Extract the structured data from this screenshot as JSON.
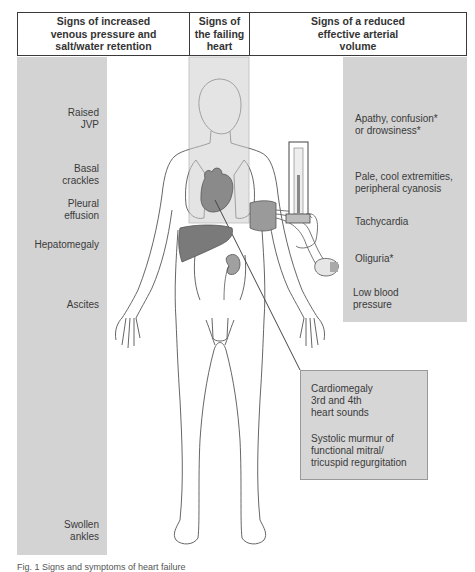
{
  "header": {
    "columns": [
      {
        "label": "Signs of increased venous pressure and salt/water retention",
        "lines": [
          "Signs of increased",
          "venous pressure and",
          "salt/water retention"
        ]
      },
      {
        "label": "Signs of the failing heart",
        "lines": [
          "Signs of",
          "the failing",
          "heart"
        ]
      },
      {
        "label": "Signs of a reduced effective arterial volume",
        "lines": [
          "Signs of a reduced",
          "effective arterial",
          "volume"
        ]
      }
    ]
  },
  "left_signs": [
    {
      "lines": [
        "Raised",
        "JVP"
      ]
    },
    {
      "lines": [
        "Basal",
        "crackles"
      ]
    },
    {
      "lines": [
        "Pleural",
        "effusion"
      ]
    },
    {
      "lines": [
        "Hepatomegaly"
      ]
    },
    {
      "lines": [
        "Ascites"
      ]
    },
    {
      "lines": [
        "Swollen",
        "ankles"
      ]
    }
  ],
  "right_signs": [
    {
      "lines": [
        "Apathy, confusion*",
        "or drowsiness*"
      ]
    },
    {
      "lines": [
        "Pale, cool extremities,",
        "peripheral cyanosis"
      ]
    },
    {
      "lines": [
        "Tachycardia"
      ]
    },
    {
      "lines": [
        "Oliguria*"
      ]
    },
    {
      "lines": [
        "Low blood",
        "pressure"
      ]
    }
  ],
  "heart_signs": [
    {
      "lines": [
        "Cardiomegaly",
        "3rd and 4th",
        "heart sounds"
      ]
    },
    {
      "lines": [
        "Systolic murmur of",
        "functional mitral/",
        "tricuspid regurgitation"
      ]
    }
  ],
  "illustration": {
    "subject": "human-body-outline",
    "organs": [
      "heart",
      "lungs",
      "liver",
      "kidney"
    ],
    "device": "sphygmomanometer"
  },
  "caption": "Fig. 1 Signs and symptoms of heart failure",
  "colors": {
    "panel_gray": "#d3d3d3",
    "organ_gray": "#8a8a8a",
    "line": "#555555"
  }
}
